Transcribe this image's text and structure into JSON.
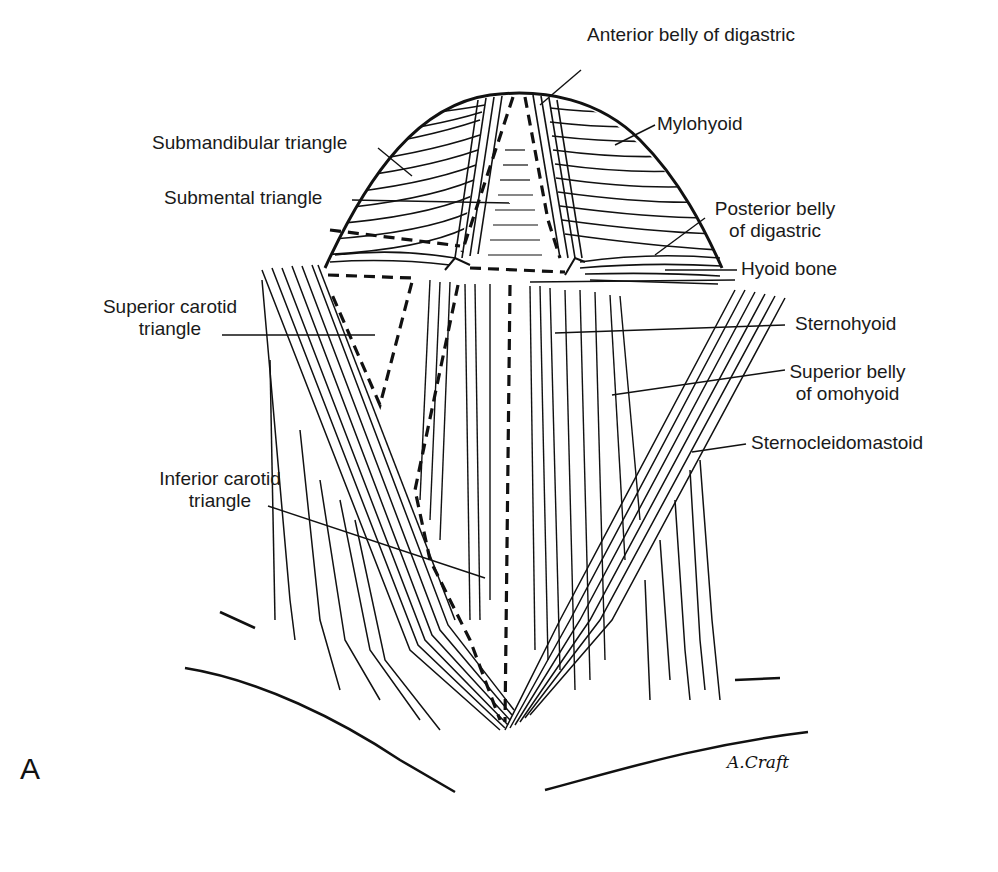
{
  "figure": {
    "panel_letter": "A",
    "signature": "A.Craft",
    "line_color": "#111111",
    "background": "#ffffff"
  },
  "labels": {
    "anterior_belly_digastric": "Anterior belly of digastric",
    "mylohyoid": "Mylohyoid",
    "submandibular_triangle": "Submandibular triangle",
    "submental_triangle": "Submental triangle",
    "posterior_belly_digastric_1": "Posterior belly",
    "posterior_belly_digastric_2": "of digastric",
    "hyoid_bone": "Hyoid bone",
    "superior_carotid_triangle_1": "Superior carotid",
    "superior_carotid_triangle_2": "triangle",
    "sternohyoid": "Sternohyoid",
    "superior_belly_omohyoid_1": "Superior belly",
    "superior_belly_omohyoid_2": "of omohyoid",
    "sternocleidomastoid": "Sternocleidomastoid",
    "inferior_carotid_triangle_1": "Inferior carotid",
    "inferior_carotid_triangle_2": "triangle"
  }
}
